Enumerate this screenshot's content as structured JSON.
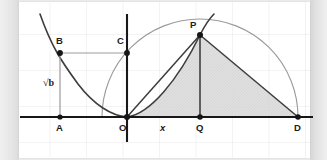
{
  "figure": {
    "canvas": {
      "width": 327,
      "height": 160
    },
    "background_color": "#ececed",
    "panel_color": "#ffffff",
    "grid_color": "#e8e8ea",
    "axis_color": "#1f1f1f",
    "curve_color": "#3a3a3a",
    "semicircle_color": "#8d8d8d",
    "shade_fill": "#d9d9d9",
    "point_color": "#151515"
  },
  "labels": {
    "A": "A",
    "B": "B",
    "C": "C",
    "O": "O",
    "P": "P",
    "Q": "Q",
    "D": "D",
    "x": "x",
    "sqrt_b": "√b"
  },
  "geometry": {
    "axis_y": 117,
    "x_axis_start": 20,
    "x_axis_end": 313,
    "y_axis_x": 127,
    "y_axis_top": 14,
    "y_axis_bottom": 142,
    "points": {
      "A": {
        "x": 60,
        "y": 117
      },
      "B": {
        "x": 60,
        "y": 53
      },
      "C": {
        "x": 127,
        "y": 53
      },
      "O": {
        "x": 127,
        "y": 117
      },
      "P": {
        "x": 200,
        "y": 35
      },
      "Q": {
        "x": 200,
        "y": 117
      },
      "D": {
        "x": 298,
        "y": 117
      }
    },
    "semicircle": {
      "cx": 200,
      "cy": 117,
      "r": 98
    },
    "left_parabola_vertex": {
      "x": 127,
      "y": 117
    }
  },
  "label_positions": {
    "A": {
      "x": 56,
      "y": 123
    },
    "B": {
      "x": 56,
      "y": 36
    },
    "C": {
      "x": 117,
      "y": 36
    },
    "O": {
      "x": 119,
      "y": 123
    },
    "P": {
      "x": 190,
      "y": 20
    },
    "Q": {
      "x": 196,
      "y": 123
    },
    "D": {
      "x": 294,
      "y": 123
    },
    "x": {
      "x": 160,
      "y": 123
    },
    "sqrt_b": {
      "x": 43,
      "y": 78
    }
  }
}
